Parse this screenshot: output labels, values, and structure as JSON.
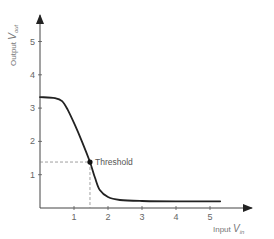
{
  "chart_data": {
    "type": "line",
    "title": "",
    "xlabel": "Input V_in",
    "ylabel": "Output V_out",
    "xlabel_main": "Input",
    "xlabel_var": "V",
    "xlabel_sub": "in",
    "ylabel_main": "Output",
    "ylabel_var": "V",
    "ylabel_sub": "out",
    "xlim": [
      0,
      6
    ],
    "ylim": [
      0,
      5.8
    ],
    "x_ticks": [
      1,
      2,
      3,
      4,
      5
    ],
    "y_ticks": [
      1,
      2,
      3,
      4,
      5
    ],
    "grid": false,
    "legend": null,
    "series": [
      {
        "name": "Transfer characteristic",
        "x": [
          0,
          0.44,
          0.65,
          0.82,
          1.03,
          1.24,
          1.47,
          1.62,
          1.76,
          2.0,
          2.35,
          3.0,
          4.0,
          5.3
        ],
        "y": [
          3.33,
          3.3,
          3.21,
          2.94,
          2.49,
          1.98,
          1.38,
          0.9,
          0.54,
          0.33,
          0.24,
          0.21,
          0.2,
          0.2
        ]
      }
    ],
    "annotations": [
      {
        "label": "Threshold",
        "x": 1.47,
        "y": 1.38,
        "marker": "dot",
        "dashed_guides": true
      }
    ]
  },
  "labels": {
    "threshold": "Threshold"
  }
}
